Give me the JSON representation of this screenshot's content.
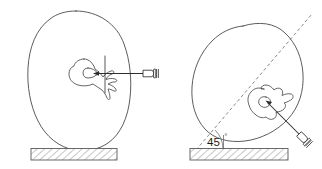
{
  "figure": {
    "background_color": "#ffffff",
    "width": 322,
    "height": 169,
    "line_color": "#4a4a4a",
    "needle_color": "#2e2e2e",
    "guide_color": "#7d7d7d",
    "hatch_color": "#6b6b6b"
  },
  "panels": [
    {
      "id": "left-panel",
      "name": "perpendicular-insertion-panel",
      "body_name": "patient-body-cross-section",
      "vertebra_name": "vertebra-axial-view",
      "needle_name": "needle-horizontal",
      "ground_name": "hatched-ground-surface",
      "insertion_angle": "",
      "angle_label_visible": false,
      "orientation": "upright"
    },
    {
      "id": "right-panel",
      "name": "angled-insertion-panel",
      "body_name": "patient-body-cross-section-rotated",
      "vertebra_name": "vertebra-axial-view-rotated",
      "needle_name": "needle-angled",
      "ground_name": "hatched-ground-surface",
      "guide_name": "dashed-trajectory-line",
      "insertion_angle": "45",
      "angle_label_visible": true,
      "orientation": "rotated-45-degrees"
    }
  ],
  "labels": {
    "angle_value": "45",
    "degree_symbol": "°"
  }
}
